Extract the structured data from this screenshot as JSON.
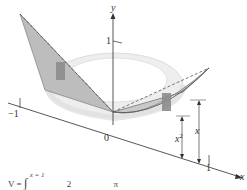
{
  "figure": {
    "axes": {
      "y_label": "y",
      "x_label": "x",
      "origin_label": "0",
      "y_tick_label": "1",
      "x_pos_tick_label": "1",
      "x_neg_tick_label": "−1"
    },
    "dimension_labels": {
      "outer": "x",
      "inner": "x",
      "inner_exp": "2"
    },
    "formula": {
      "lhs": "V =",
      "upper_limit": "x = 1",
      "integral_sign": "∫",
      "fragment": "2",
      "pi_fragment": "π"
    },
    "colors": {
      "axis": "#444444",
      "surface_light": "#e6e6e6",
      "surface_mid": "#c8c8c8",
      "surface_dark": "#8c8c8c",
      "ring": "#eeeeee"
    }
  }
}
